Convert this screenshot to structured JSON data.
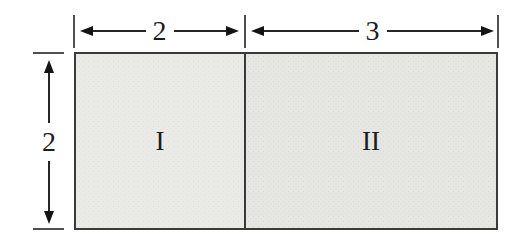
{
  "figure": {
    "type": "geometry-diagram",
    "top_dimensions": [
      {
        "label": "2"
      },
      {
        "label": "3"
      }
    ],
    "side_dimension": {
      "label": "2"
    },
    "regions": [
      {
        "label": "I",
        "width": "2",
        "height": "2"
      },
      {
        "label": "II",
        "width": "3",
        "height": "2"
      }
    ],
    "colors": {
      "background": "#ffffff",
      "region_i_fill": "#eaeae7",
      "region_ii_fill": "#e6e6e3",
      "outline": "#3a3a3a",
      "arrow_line": "#262626",
      "tick": "#4f4f4f",
      "text": "#1c1c1c"
    }
  }
}
